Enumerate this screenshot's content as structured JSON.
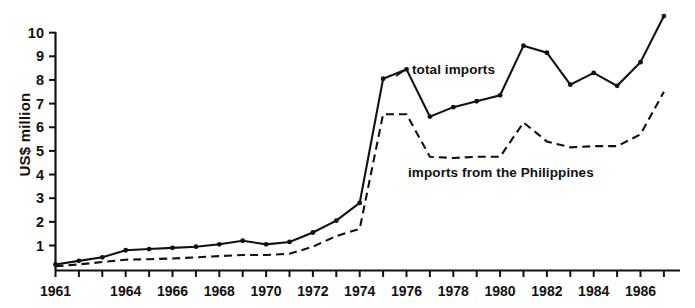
{
  "chart_data": {
    "type": "line",
    "title": "",
    "xlabel": "",
    "ylabel": "US$ million",
    "xlim": [
      1961,
      1987
    ],
    "ylim": [
      0,
      10
    ],
    "grid": false,
    "legend_position": "inline-annotation",
    "x": [
      1961,
      1962,
      1963,
      1964,
      1965,
      1966,
      1967,
      1968,
      1969,
      1970,
      1971,
      1972,
      1973,
      1974,
      1975,
      1976,
      1977,
      1978,
      1979,
      1980,
      1981,
      1982,
      1983,
      1984,
      1985,
      1986,
      1987
    ],
    "xticks": [
      "1961",
      "1964",
      "1966",
      "1968",
      "1970",
      "1972",
      "1974",
      "1976",
      "1978",
      "1980",
      "1982",
      "1984",
      "1986"
    ],
    "yticks": [
      "1",
      "2",
      "3",
      "4",
      "5",
      "6",
      "7",
      "8",
      "9",
      "10"
    ],
    "series": [
      {
        "name": "total imports",
        "style": "solid-with-markers",
        "color": "#111111",
        "values": [
          0.2,
          0.35,
          0.5,
          0.8,
          0.85,
          0.9,
          0.95,
          1.05,
          1.2,
          1.05,
          1.15,
          1.55,
          2.05,
          2.8,
          8.05,
          8.45,
          6.45,
          6.85,
          7.1,
          7.35,
          9.45,
          9.15,
          7.8,
          8.3,
          7.75,
          8.75,
          10.7
        ]
      },
      {
        "name": "imports from the Philippines",
        "style": "dashed",
        "color": "#111111",
        "values": [
          0.12,
          0.2,
          0.3,
          0.4,
          0.42,
          0.45,
          0.5,
          0.55,
          0.6,
          0.6,
          0.65,
          0.95,
          1.4,
          1.7,
          6.55,
          6.55,
          4.75,
          4.7,
          4.75,
          4.75,
          6.2,
          5.4,
          5.15,
          5.2,
          5.2,
          5.7,
          7.5
        ]
      }
    ],
    "annotations": [
      {
        "text": "total imports",
        "series": "total imports"
      },
      {
        "text": "imports from the Philippines",
        "series": "imports from the Philippines"
      }
    ]
  },
  "labels": {
    "y_axis_title": "US$ million",
    "total_imports": "total imports",
    "philippines_imports": "imports from the Philippines"
  }
}
